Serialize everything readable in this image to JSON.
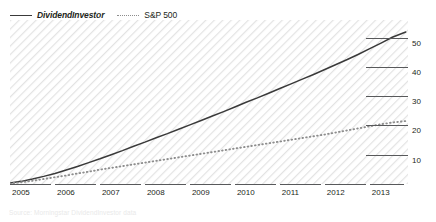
{
  "legend": {
    "items": [
      {
        "label": "DividendInvestor",
        "style": "solid",
        "color": "#3a3a3a",
        "italic": true
      },
      {
        "label": "S&P 500",
        "style": "dotted",
        "color": "#8d8d8d",
        "italic": false
      }
    ]
  },
  "axes": {
    "y_ticks": [
      "50",
      "40",
      "30",
      "20",
      "10"
    ],
    "x_ticks": [
      "2005",
      "2006",
      "2007",
      "2008",
      "2009",
      "2010",
      "2011",
      "2012",
      "2013"
    ]
  },
  "footer": {
    "text": "Source: Morningstar DividendInvestor data"
  },
  "colors": {
    "series_primary": "#3a3a3a",
    "series_secondary": "#8d8d8d",
    "axis": "#58595b",
    "hatch": "#e6e6e6",
    "background": "#ffffff"
  },
  "chart_data": {
    "type": "line",
    "title": "",
    "subtitle": "",
    "xlabel": "",
    "ylabel": "",
    "xlim": [
      2005,
      2013.85
    ],
    "ylim": [
      0,
      56
    ],
    "grid": true,
    "legend_position": "top-left",
    "y_tick_values": [
      10,
      20,
      30,
      40,
      50
    ],
    "x_tick_values": [
      2005,
      2006,
      2007,
      2008,
      2009,
      2010,
      2011,
      2012,
      2013
    ],
    "x": [
      2005.0,
      2005.25,
      2005.5,
      2005.75,
      2006.0,
      2006.25,
      2006.5,
      2006.75,
      2007.0,
      2007.25,
      2007.5,
      2007.75,
      2008.0,
      2008.25,
      2008.5,
      2008.75,
      2009.0,
      2009.25,
      2009.5,
      2009.75,
      2010.0,
      2010.25,
      2010.5,
      2010.75,
      2011.0,
      2011.25,
      2011.5,
      2011.75,
      2012.0,
      2012.25,
      2012.5,
      2012.75,
      2013.0,
      2013.25,
      2013.5,
      2013.8
    ],
    "series": [
      {
        "name": "DividendInvestor",
        "style": "solid",
        "color": "#3a3a3a",
        "values": [
          0.3,
          0.9,
          1.7,
          2.6,
          3.6,
          4.8,
          6.0,
          7.3,
          8.6,
          10.0,
          11.4,
          12.9,
          14.3,
          15.8,
          17.2,
          18.7,
          20.2,
          21.7,
          23.2,
          24.7,
          26.3,
          27.9,
          29.4,
          31.0,
          32.6,
          34.2,
          35.8,
          37.4,
          39.1,
          40.8,
          42.5,
          44.3,
          46.2,
          48.1,
          50.1,
          51.9
        ]
      },
      {
        "name": "S&P 500",
        "style": "dotted",
        "color": "#8d8d8d",
        "values": [
          0.2,
          0.6,
          1.1,
          1.7,
          2.3,
          2.9,
          3.6,
          4.2,
          4.9,
          5.5,
          6.1,
          6.7,
          7.3,
          7.9,
          8.5,
          9.1,
          9.7,
          10.3,
          10.9,
          11.5,
          12.1,
          12.7,
          13.3,
          13.9,
          14.5,
          15.1,
          15.7,
          16.3,
          16.9,
          17.6,
          18.3,
          19.0,
          19.7,
          20.4,
          21.0,
          21.5
        ]
      }
    ]
  }
}
